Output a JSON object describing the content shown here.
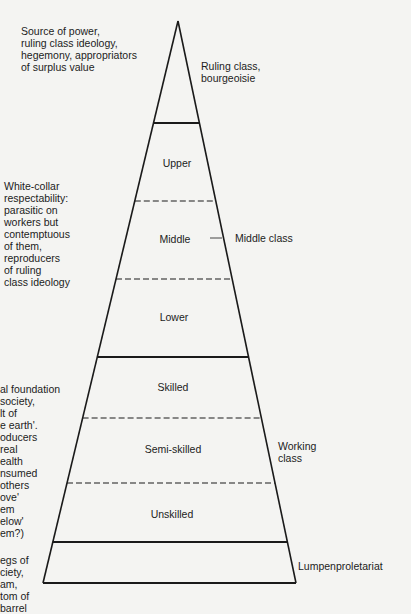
{
  "diagram": {
    "type": "class-pyramid",
    "left_annotations": {
      "ruling": "Source of power,\nruling class ideology,\nhegemony, appropriators\nof surplus value",
      "middle": "White-collar\nrespectability:\nparasitic on\nworkers but\ncontemptuous\nof them,\nreproducers\nof ruling\nclass ideology",
      "working": "al foundation\nsociety,\nlt of\ne earth'.\noducers\nreal\nealth\nnsumed\nothers\nove'\nem\nelow'\nem?)",
      "lumpen": "egs of\nciety,\nam,\ntom of\nbarrel"
    },
    "right_labels": {
      "ruling": "Ruling class,\nbourgeoisie",
      "middle": "Middle class",
      "working": "Working\nclass",
      "lumpen": "Lumpenproletariat"
    },
    "tiers": [
      {
        "label": "Upper",
        "group": "middle"
      },
      {
        "label": "Middle",
        "group": "middle"
      },
      {
        "label": "Lower",
        "group": "middle"
      },
      {
        "label": "Skilled",
        "group": "working"
      },
      {
        "label": "Semi-skilled",
        "group": "working"
      },
      {
        "label": "Unskilled",
        "group": "working"
      }
    ],
    "colors": {
      "background": "#f4f4f2",
      "line": "#1a1a1a",
      "text": "#1c1c1c"
    }
  }
}
